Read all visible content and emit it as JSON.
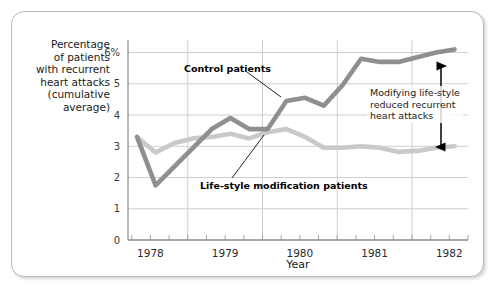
{
  "chart_data": {
    "type": "line",
    "title": "",
    "xlabel": "Year",
    "ylabel": "Percentage of patients with recurrent heart attacks (cumulative average)",
    "ylabel_lines": [
      "Percentage",
      "of patients",
      "with recurrent",
      "heart attacks",
      "(cumulative",
      "average)"
    ],
    "xlim": [
      1977.7,
      1982.25
    ],
    "ylim": [
      0,
      6.4
    ],
    "y_ticks": [
      0,
      1,
      2,
      3,
      4,
      5,
      6
    ],
    "y_tick_labels": [
      "0",
      "1",
      "2",
      "3",
      "4",
      "5",
      "6%"
    ],
    "x_ticks": [
      1978,
      1979,
      1980,
      1981,
      1982
    ],
    "x_tick_labels": [
      "1978",
      "1979",
      "1980",
      "1981",
      "1982"
    ],
    "x_minor_tick_step": 0.25,
    "grid": {
      "horizontal": true,
      "vertical": true,
      "color": "#c9c9c9"
    },
    "legend_position": "inline-annotations",
    "series": [
      {
        "name": "Control patients",
        "color": "#8f8f8f",
        "x": [
          1977.82,
          1978.07,
          1978.32,
          1978.57,
          1978.82,
          1979.07,
          1979.32,
          1979.57,
          1979.82,
          1980.07,
          1980.32,
          1980.57,
          1980.82,
          1981.07,
          1981.32,
          1981.57,
          1981.82,
          1982.07
        ],
        "y": [
          3.3,
          1.75,
          2.35,
          2.95,
          3.55,
          3.9,
          3.55,
          3.55,
          4.45,
          4.55,
          4.3,
          4.95,
          5.8,
          5.7,
          5.7,
          5.85,
          6.0,
          6.1
        ]
      },
      {
        "name": "Life-style modification patients",
        "color": "#c9c9c9",
        "x": [
          1977.82,
          1978.07,
          1978.32,
          1978.57,
          1978.82,
          1979.07,
          1979.32,
          1979.57,
          1979.82,
          1980.07,
          1980.32,
          1980.57,
          1980.82,
          1981.07,
          1981.32,
          1981.57,
          1981.82,
          1982.07
        ],
        "y": [
          3.3,
          2.8,
          3.1,
          3.25,
          3.3,
          3.4,
          3.25,
          3.45,
          3.55,
          3.3,
          2.95,
          2.95,
          3.0,
          2.95,
          2.82,
          2.85,
          2.95,
          3.0
        ]
      }
    ],
    "annotations": [
      {
        "name": "control-callout",
        "text": "Control patients"
      },
      {
        "name": "lifestyle-callout",
        "text": "Life-style modification patients"
      },
      {
        "name": "gap-note",
        "lines": [
          "Modifying life-style",
          "reduced recurrent",
          "heart attacks"
        ],
        "arrow": "double-headed-vertical"
      }
    ]
  }
}
